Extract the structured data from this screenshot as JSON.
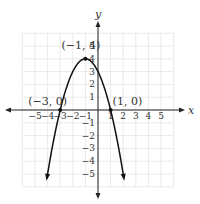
{
  "chart_data": {
    "type": "line",
    "title": "",
    "function": "y = -(x+1)^2 + 4",
    "xlabel": "x",
    "ylabel": "y",
    "xlim": [
      -6,
      6
    ],
    "ylim": [
      -6,
      6
    ],
    "grid": true,
    "x_ticks": [
      "-5",
      "-4",
      "-3",
      "-2",
      "-1",
      "1",
      "2",
      "3",
      "4",
      "5"
    ],
    "y_ticks": [
      "5",
      "4",
      "3",
      "2",
      "1",
      "-1",
      "-2",
      "-3",
      "-4",
      "-5"
    ],
    "series": [
      {
        "name": "parabola",
        "x": [
          -4.1,
          -4,
          -3,
          -2,
          -1,
          0,
          1,
          2,
          2.1
        ],
        "y": [
          -5.61,
          -5,
          0,
          3,
          4,
          3,
          0,
          -5,
          -5.61
        ]
      }
    ],
    "annotations": [
      {
        "label": "(−1, 4)",
        "x": -1,
        "y": 4
      },
      {
        "label": "(−3, 0)",
        "x": -3,
        "y": 0
      },
      {
        "label": "(1, 0)",
        "x": 1,
        "y": 0
      }
    ]
  }
}
